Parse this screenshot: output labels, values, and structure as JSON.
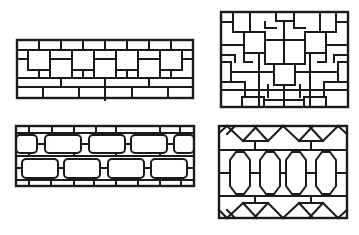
{
  "figure": {
    "panels": [
      {
        "id": "panel-1",
        "pattern": "square fret band with offset squares",
        "position": "top-left"
      },
      {
        "id": "panel-2",
        "pattern": "square lattice with T-shaped frets",
        "position": "top-right"
      },
      {
        "id": "panel-3",
        "pattern": "rounded rectangle brick lattice",
        "position": "bottom-left"
      },
      {
        "id": "panel-4",
        "pattern": "elongated octagon lattice with crossed frets",
        "position": "bottom-right"
      }
    ],
    "line_color": "#1a1a1a",
    "background": "#ffffff"
  }
}
